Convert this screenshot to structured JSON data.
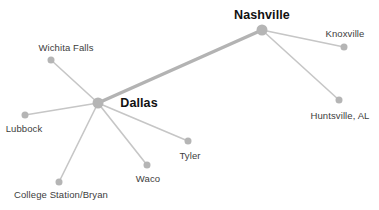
{
  "diagram": {
    "background_color": "#ffffff",
    "node_color": "#b5b5b5",
    "edge_color": "#c6c6c6",
    "thick_edge_color": "#b3b3b3",
    "label_color": "#3d3d3d",
    "hub_label_color": "#111111",
    "nodes": [
      {
        "id": "dallas",
        "label": "Dallas",
        "x": 98,
        "y": 103,
        "r": 5.5,
        "hub": true,
        "label_x": 139,
        "label_y": 103
      },
      {
        "id": "nashville",
        "label": "Nashville",
        "x": 262,
        "y": 30,
        "r": 5.5,
        "hub": true,
        "label_x": 262,
        "label_y": 15
      },
      {
        "id": "wichita-falls",
        "label": "Wichita Falls",
        "x": 51,
        "y": 60,
        "r": 3.5,
        "hub": false,
        "label_x": 66,
        "label_y": 47
      },
      {
        "id": "lubbock",
        "label": "Lubbock",
        "x": 25,
        "y": 115,
        "r": 3.5,
        "hub": false,
        "label_x": 24,
        "label_y": 128
      },
      {
        "id": "college-station",
        "label": "College Station/Bryan",
        "x": 59,
        "y": 182,
        "r": 3.5,
        "hub": false,
        "label_x": 61,
        "label_y": 194
      },
      {
        "id": "waco",
        "label": "Waco",
        "x": 147,
        "y": 165,
        "r": 3.5,
        "hub": false,
        "label_x": 148,
        "label_y": 178
      },
      {
        "id": "tyler",
        "label": "Tyler",
        "x": 188,
        "y": 141,
        "r": 3.5,
        "hub": false,
        "label_x": 190,
        "label_y": 155
      },
      {
        "id": "knoxville",
        "label": "Knoxville",
        "x": 344,
        "y": 47,
        "r": 3.5,
        "hub": false,
        "label_x": 345,
        "label_y": 33
      },
      {
        "id": "huntsville",
        "label": "Huntsville, AL",
        "x": 339,
        "y": 100,
        "r": 3.5,
        "hub": false,
        "label_x": 340,
        "label_y": 115
      }
    ],
    "edges": [
      {
        "from": "dallas",
        "to": "nashville",
        "thick": true
      },
      {
        "from": "dallas",
        "to": "wichita-falls",
        "thick": false
      },
      {
        "from": "dallas",
        "to": "lubbock",
        "thick": false
      },
      {
        "from": "dallas",
        "to": "college-station",
        "thick": false
      },
      {
        "from": "dallas",
        "to": "waco",
        "thick": false
      },
      {
        "from": "dallas",
        "to": "tyler",
        "thick": false
      },
      {
        "from": "nashville",
        "to": "knoxville",
        "thick": false
      },
      {
        "from": "nashville",
        "to": "huntsville",
        "thick": false
      }
    ]
  }
}
